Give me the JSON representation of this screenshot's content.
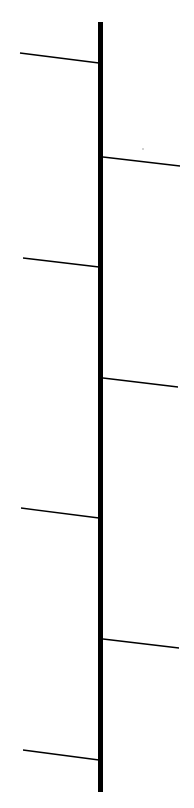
{
  "diagram": {
    "type": "fishbone-spine",
    "background": "#ffffff",
    "stroke_color": "#000000",
    "spine": {
      "x": 100.5,
      "y1": 22,
      "y2": 792,
      "width": 5
    },
    "branches": [
      {
        "side": "left",
        "x1": 20,
        "y1": 53,
        "x2": 99,
        "y2": 63
      },
      {
        "side": "right",
        "x1": 103,
        "y1": 157,
        "x2": 180,
        "y2": 166
      },
      {
        "side": "left",
        "x1": 23,
        "y1": 258,
        "x2": 99,
        "y2": 267
      },
      {
        "side": "right",
        "x1": 103,
        "y1": 378,
        "x2": 178,
        "y2": 387
      },
      {
        "side": "left",
        "x1": 21,
        "y1": 508,
        "x2": 99,
        "y2": 518
      },
      {
        "side": "right",
        "x1": 103,
        "y1": 639,
        "x2": 179,
        "y2": 648
      },
      {
        "side": "left",
        "x1": 23,
        "y1": 750,
        "x2": 99,
        "y2": 760
      }
    ],
    "dots": [
      {
        "x": 143,
        "y": 149,
        "r": 0.8
      }
    ]
  }
}
